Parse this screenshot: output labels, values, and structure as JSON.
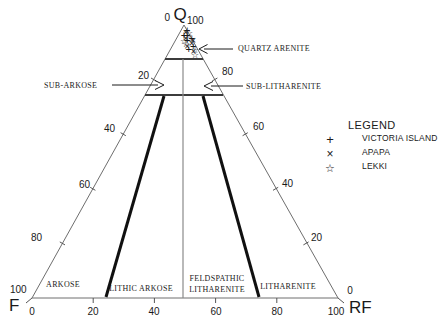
{
  "chart_data": {
    "type": "scatter",
    "variant": "ternary-sandstone-classification",
    "grid": false,
    "vertices": {
      "top": {
        "letter": "Q",
        "left_value": "0",
        "right_value": "100"
      },
      "bottom_left": {
        "letter": "F",
        "upper_value": "100"
      },
      "bottom_right": {
        "letter": "RF",
        "upper_value": "0"
      }
    },
    "axis_ticks": {
      "left_edge": [
        "20",
        "40",
        "60",
        "80"
      ],
      "right_edge": [
        "80",
        "60",
        "40",
        "20"
      ],
      "bottom_edge": [
        "0",
        "20",
        "40",
        "60",
        "80",
        "100"
      ]
    },
    "field_labels": {
      "quartz_arenite": "QUARTZ ARENITE",
      "sub_arkose": "SUB-ARKOSE",
      "sub_litharenite": "SUB-LITHARENITE",
      "arkose": "ARKOSE",
      "lithic_arkose": "LITHIC ARKOSE",
      "feldspathic_line1": "FELDSPATHIC",
      "feldspathic_line2": "LITHARENITE",
      "litharenite": "LITHARENITE"
    },
    "legend": {
      "title": "LEGEND",
      "entries": [
        {
          "symbol": "+",
          "label": "VICTORIA ISLAND"
        },
        {
          "symbol": "×",
          "label": "APAPA"
        },
        {
          "symbol": "☆",
          "label": "LEKKI"
        }
      ]
    },
    "series": [
      {
        "name": "VICTORIA ISLAND",
        "symbol": "+",
        "points": [
          {
            "Q": 98,
            "F": 0,
            "RF": 2
          },
          {
            "Q": 96,
            "F": 1,
            "RF": 3
          },
          {
            "Q": 95,
            "F": 0,
            "RF": 5
          },
          {
            "Q": 94,
            "F": 2,
            "RF": 4
          },
          {
            "Q": 92,
            "F": 1,
            "RF": 7
          },
          {
            "Q": 91,
            "F": 3,
            "RF": 6
          },
          {
            "Q": 96,
            "F": 2,
            "RF": 2
          }
        ]
      },
      {
        "name": "APAPA",
        "symbol": "×",
        "points": [
          {
            "Q": 97,
            "F": 1,
            "RF": 2
          },
          {
            "Q": 95,
            "F": 2,
            "RF": 3
          },
          {
            "Q": 93,
            "F": 1,
            "RF": 6
          },
          {
            "Q": 92,
            "F": 3,
            "RF": 5
          },
          {
            "Q": 90,
            "F": 2,
            "RF": 8
          },
          {
            "Q": 94,
            "F": 0,
            "RF": 6
          }
        ]
      },
      {
        "name": "LEKKI",
        "symbol": "☆",
        "points": [
          {
            "Q": 97,
            "F": 0,
            "RF": 3
          },
          {
            "Q": 95,
            "F": 1,
            "RF": 4
          },
          {
            "Q": 93,
            "F": 3,
            "RF": 4
          },
          {
            "Q": 91,
            "F": 1,
            "RF": 8
          },
          {
            "Q": 89,
            "F": 2,
            "RF": 9
          },
          {
            "Q": 94,
            "F": 3,
            "RF": 3
          }
        ]
      }
    ],
    "colors": {
      "ink": "#1a1a1a",
      "edge_line": "#6e6e6e",
      "band_line": "#3c3c3c",
      "center_line": "#8a8a8a",
      "bold_line": "#101010",
      "marker": "#111111"
    }
  }
}
